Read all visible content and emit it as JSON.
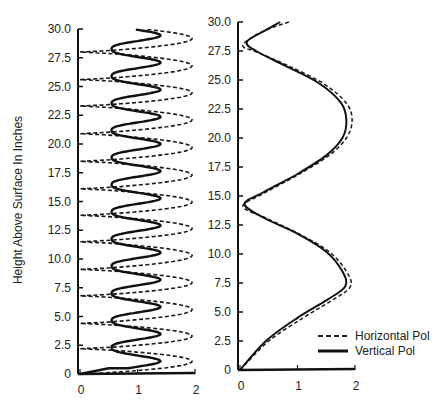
{
  "chart_data": [
    {
      "type": "line",
      "panel": "left",
      "title": "",
      "xlabel": "",
      "ylabel": "Height Above Surface In Inches",
      "xlim": [
        0,
        2
      ],
      "ylim": [
        0,
        30
      ],
      "x_ticks": [
        "0",
        "1",
        "2"
      ],
      "y_ticks": [
        "0",
        "2.5",
        "5.0",
        "7.5",
        "10.0",
        "12.5",
        "15.0",
        "17.5",
        "20.0",
        "22.5",
        "25.0",
        "27.5",
        "30.0"
      ],
      "grid": false,
      "series": [
        {
          "name": "Horizontal Pol",
          "style": "dashed",
          "nulls_at_height": [
            0,
            2.2,
            4.4,
            6.8,
            9.1,
            11.5,
            13.8,
            16.1,
            18.5,
            20.9,
            23.3,
            25.6,
            28.0
          ],
          "peak_value": 1.95,
          "description": "Standing-wave pattern: lobes reaching ~1.95 midway between nulls near 0"
        },
        {
          "name": "Vertical Pol",
          "style": "solid",
          "minimum_value": 0.55,
          "peak_value": 1.4,
          "minima_at_height": [
            2.3,
            4.6,
            7.0,
            9.3,
            11.7,
            14.0,
            16.4,
            18.8,
            21.1,
            23.5,
            25.9,
            28.3
          ],
          "description": "Oscillates between ~0.55 and ~1.4 with same period as horizontal pol"
        }
      ]
    },
    {
      "type": "line",
      "panel": "right",
      "title": "",
      "xlabel": "",
      "ylabel": "",
      "xlim": [
        0,
        2
      ],
      "ylim": [
        0,
        30
      ],
      "x_ticks": [
        "0",
        "1",
        "2"
      ],
      "y_ticks": [
        "0",
        "2.5",
        "5.0",
        "7.5",
        "10.0",
        "12.5",
        "15.0",
        "17.5",
        "20.0",
        "22.5",
        "25.0",
        "27.5",
        "30.0"
      ],
      "grid": false,
      "legend": {
        "position": "lower right",
        "entries": [
          "Horizontal Pol",
          "Vertical Pol"
        ]
      },
      "series": [
        {
          "name": "Horizontal Pol",
          "style": "dashed",
          "points": [
            [
              0,
              0
            ],
            [
              0.5,
              2.5
            ],
            [
              1.1,
              4.5
            ],
            [
              1.6,
              6
            ],
            [
              1.92,
              7.2
            ],
            [
              1.85,
              8.5
            ],
            [
              1.55,
              10.2
            ],
            [
              1.0,
              11.8
            ],
            [
              0.45,
              13.1
            ],
            [
              0.05,
              14.1
            ],
            [
              0.4,
              15.2
            ],
            [
              1.0,
              16.8
            ],
            [
              1.55,
              18.5
            ],
            [
              1.85,
              20
            ],
            [
              1.95,
              21.5
            ],
            [
              1.85,
              23
            ],
            [
              1.45,
              24.7
            ],
            [
              0.85,
              26.2
            ],
            [
              0.3,
              27.4
            ],
            [
              0.05,
              28.0
            ],
            [
              0.4,
              29.2
            ],
            [
              0.85,
              30
            ]
          ]
        },
        {
          "name": "Vertical Pol",
          "style": "solid",
          "points": [
            [
              0,
              0
            ],
            [
              0.45,
              2.5
            ],
            [
              1.0,
              4.5
            ],
            [
              1.5,
              6
            ],
            [
              1.83,
              7.2
            ],
            [
              1.78,
              8.5
            ],
            [
              1.5,
              10.2
            ],
            [
              0.98,
              11.8
            ],
            [
              0.42,
              13.1
            ],
            [
              0.08,
              14.3
            ],
            [
              0.4,
              15.3
            ],
            [
              1.0,
              16.9
            ],
            [
              1.5,
              18.5
            ],
            [
              1.78,
              20
            ],
            [
              1.85,
              21.5
            ],
            [
              1.76,
              23
            ],
            [
              1.38,
              24.7
            ],
            [
              0.8,
              26.2
            ],
            [
              0.28,
              27.5
            ],
            [
              0.12,
              28.3
            ],
            [
              0.45,
              29.3
            ],
            [
              0.7,
              30
            ]
          ]
        }
      ]
    }
  ],
  "labels": {
    "ylabel": "Height Above Surface In Inches",
    "legend_horizontal": "Horizontal Pol",
    "legend_vertical": "Vertical Pol"
  }
}
